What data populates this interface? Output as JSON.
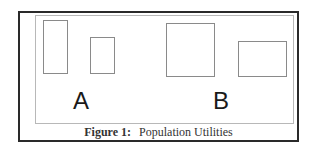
{
  "figure": {
    "groups": [
      {
        "label": "A",
        "rects": [
          {
            "x": 43,
            "y": 20,
            "w": 25,
            "h": 54
          },
          {
            "x": 90,
            "y": 37,
            "w": 25,
            "h": 37
          }
        ],
        "label_pos": {
          "x": 73,
          "y": 90
        }
      },
      {
        "label": "B",
        "rects": [
          {
            "x": 166,
            "y": 23,
            "w": 49,
            "h": 54
          },
          {
            "x": 238,
            "y": 41,
            "w": 49,
            "h": 36
          }
        ],
        "label_pos": {
          "x": 213,
          "y": 90
        }
      }
    ],
    "caption_label": "Figure 1:",
    "caption_text": "Population Utilities"
  }
}
